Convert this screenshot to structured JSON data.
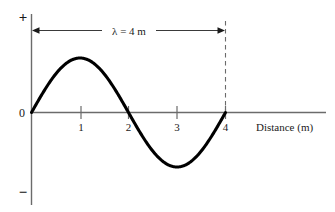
{
  "chart_data": {
    "type": "line",
    "title": "",
    "subtitle": "",
    "xlabel": "Distance (m)",
    "ylabel": "",
    "xlim": [
      0,
      6.05
    ],
    "ylim": [
      -1.28,
      1.28
    ],
    "xticks": [
      1,
      2,
      3,
      4
    ],
    "xtick_labels": [
      "1",
      "2",
      "3",
      "4"
    ],
    "yticks": [],
    "ytick_labels": [],
    "grid": false,
    "legend": null,
    "axis_signs": {
      "positive": "+",
      "negative": "−",
      "origin": "0"
    },
    "annotations": [
      {
        "name": "wavelength-span",
        "text": "λ = 4 m",
        "x_start": 0,
        "x_end": 4,
        "style": "double-headed-arrow"
      },
      {
        "name": "wavelength-guide",
        "text": "",
        "x": 4,
        "style": "dashed-vertical"
      }
    ],
    "series": [
      {
        "name": "wave",
        "equation": "y = sin(2*pi*x/4)",
        "wavelength": 4,
        "amplitude": 1,
        "x": [
          0,
          0.2,
          0.4,
          0.6,
          0.8,
          1.0,
          1.2,
          1.4,
          1.6,
          1.8,
          2.0,
          2.2,
          2.4,
          2.6,
          2.8,
          3.0,
          3.2,
          3.4,
          3.6,
          3.8,
          4.0
        ],
        "values": [
          0.0,
          0.309,
          0.588,
          0.809,
          0.951,
          1.0,
          0.951,
          0.809,
          0.588,
          0.309,
          0.0,
          -0.309,
          -0.588,
          -0.809,
          -0.951,
          -1.0,
          -0.951,
          -0.809,
          -0.588,
          -0.309,
          0.0
        ]
      }
    ]
  },
  "colors": {
    "curve": "#000000",
    "axis": "#555555",
    "annotation": "#333333",
    "background": "#ffffff"
  }
}
